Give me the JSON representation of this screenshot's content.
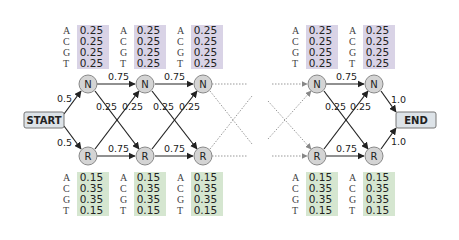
{
  "diagram": {
    "start_label": "START",
    "end_label": "END",
    "start_to_N": "0.5",
    "start_to_R": "0.5",
    "N_to_end": "1.0",
    "R_to_end": "1.0",
    "stay_prob": "0.75",
    "switch_prob": "0.25",
    "states": {
      "N": {
        "label": "N",
        "name": "neutral",
        "color": "#d9d3e6"
      },
      "R": {
        "label": "R",
        "name": "rich",
        "color": "#d5e6d0"
      }
    },
    "emissions": {
      "N": [
        {
          "base": "A",
          "prob": "0.25"
        },
        {
          "base": "C",
          "prob": "0.25"
        },
        {
          "base": "G",
          "prob": "0.25"
        },
        {
          "base": "T",
          "prob": "0.25"
        }
      ],
      "R": [
        {
          "base": "A",
          "prob": "0.15"
        },
        {
          "base": "C",
          "prob": "0.35"
        },
        {
          "base": "G",
          "prob": "0.35"
        },
        {
          "base": "T",
          "prob": "0.15"
        }
      ]
    },
    "columns": 5,
    "node_fill": "#d4d4d4",
    "box_fill": "#dde3e8"
  }
}
